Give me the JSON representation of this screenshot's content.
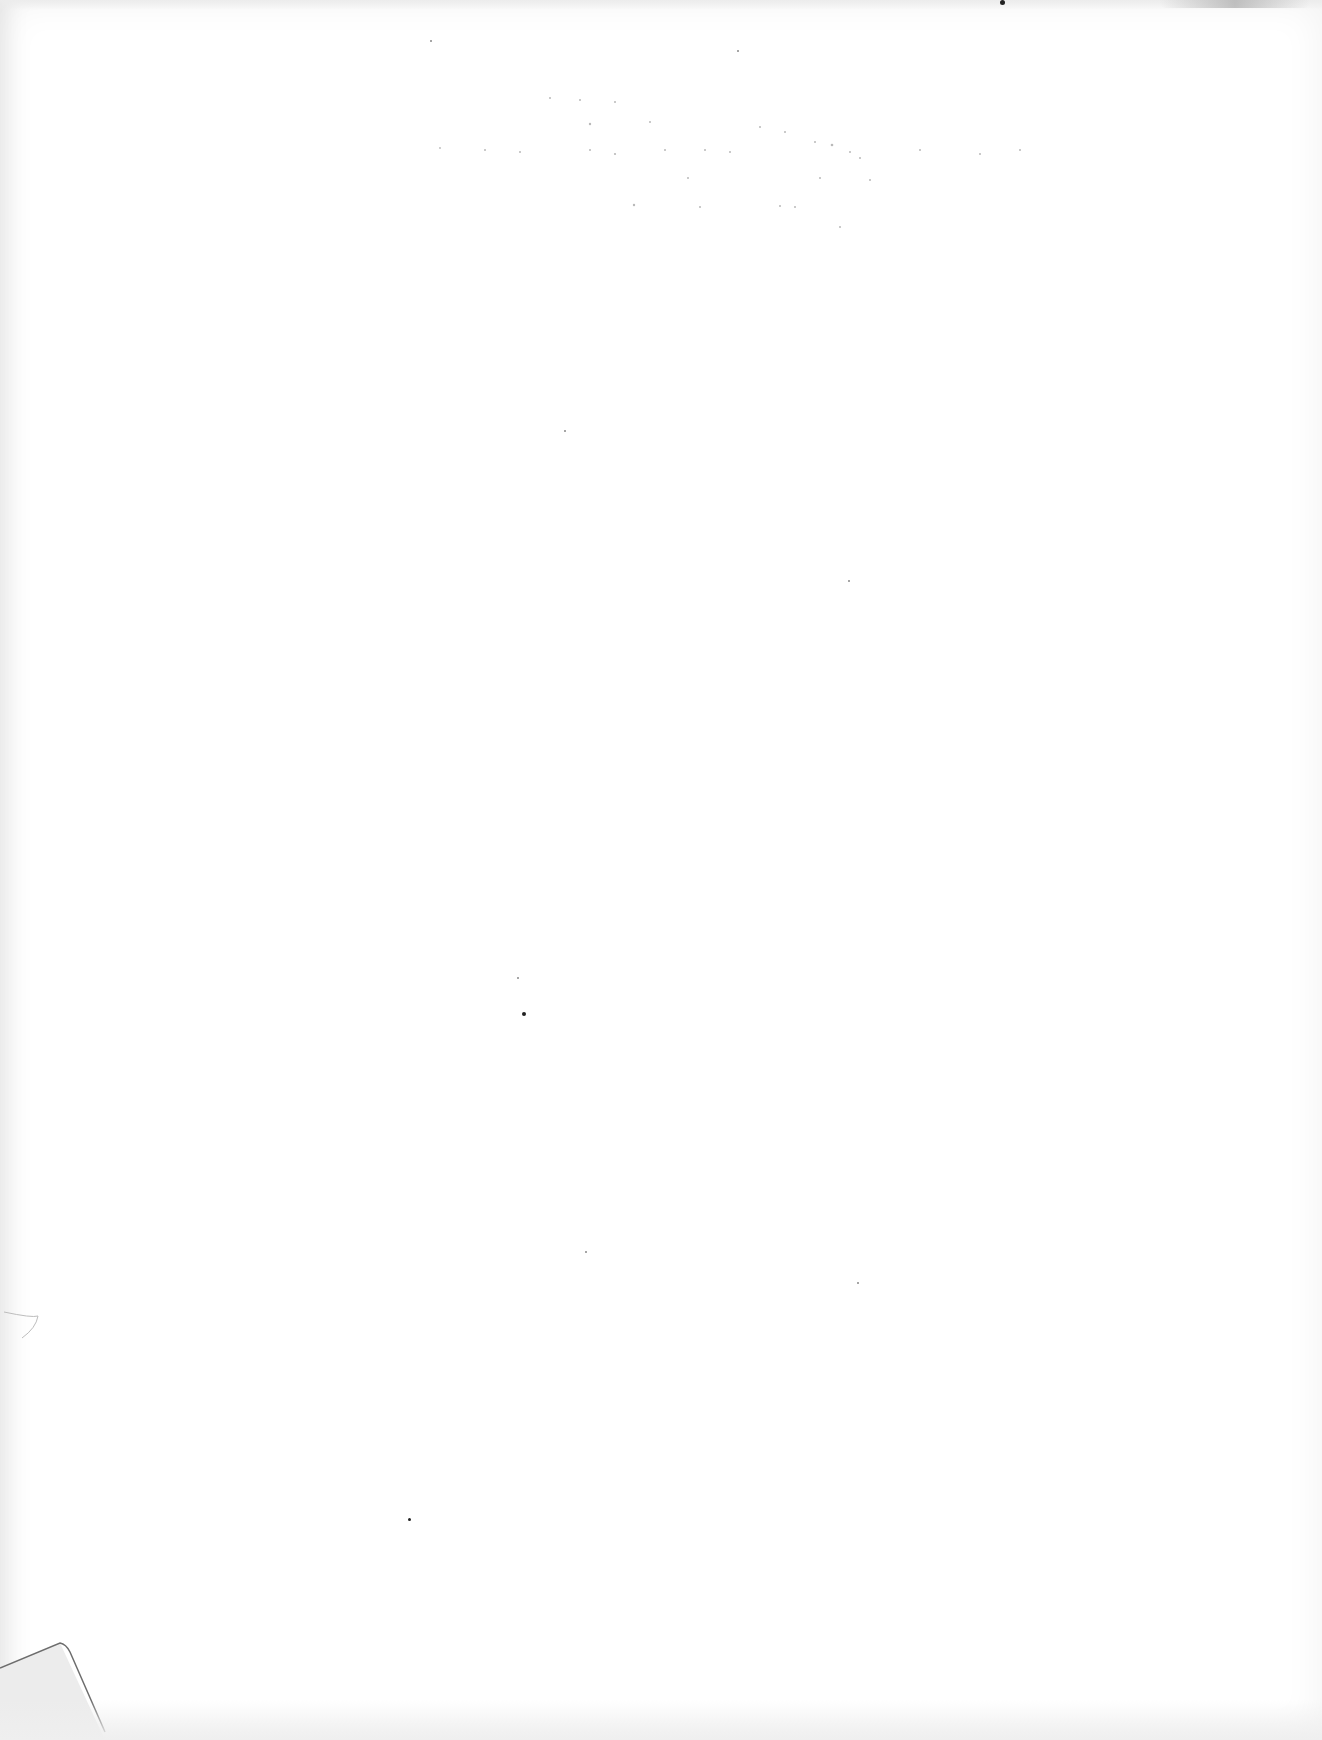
{
  "document": {
    "type": "scanned-page",
    "content": "blank",
    "visible_text": [],
    "bleed_through_lines": [
      "",
      "",
      "",
      "",
      ""
    ]
  },
  "colors": {
    "paper": "#ffffff",
    "edge_shadow": "#e9e9e9",
    "ink_speck": "#222222"
  }
}
